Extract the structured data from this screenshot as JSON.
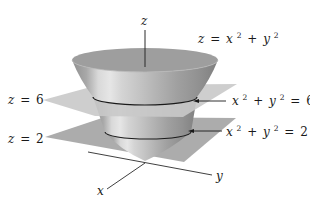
{
  "figure": {
    "axes": {
      "z_label": "z",
      "y_label": "y",
      "x_label": "x"
    },
    "surface": {
      "lhs": "z",
      "eq": "=",
      "t1": "x",
      "exp1": "2",
      "plus": "+",
      "t2": "y",
      "exp2": "2"
    },
    "planes": [
      {
        "label_var": "z",
        "label_eq": "=",
        "label_val": "6",
        "color": "#c9c9c9"
      },
      {
        "label_var": "z",
        "label_eq": "=",
        "label_val": "2",
        "color": "#a8a8a8"
      }
    ],
    "level_curves": [
      {
        "t1": "x",
        "exp1": "2",
        "plus": "+",
        "t2": "y",
        "exp2": "2",
        "eq": "=",
        "val": "6"
      },
      {
        "t1": "x",
        "exp1": "2",
        "plus": "+",
        "t2": "y",
        "exp2": "2",
        "eq": "=",
        "val": "2"
      }
    ],
    "colors": {
      "bowl_inner": "#9e9e9e",
      "bowl_dark": "#8c8c8c",
      "bowl_light": "#e2e2e2",
      "curve": "#1a1a1a",
      "axis": "#2a2a2a"
    }
  }
}
